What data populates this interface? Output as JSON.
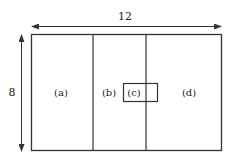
{
  "diagram": {
    "width_label": "12",
    "height_label": "8",
    "regions": [
      {
        "id": "a",
        "label": "(a)"
      },
      {
        "id": "b",
        "label": "(b)"
      },
      {
        "id": "c",
        "label": "(c)"
      },
      {
        "id": "d",
        "label": "(d)"
      }
    ],
    "colors": {
      "stroke": "#333333",
      "background": "#ffffff"
    }
  }
}
